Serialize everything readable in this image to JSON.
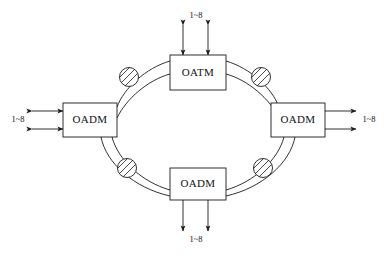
{
  "diagram": {
    "background_color": "#ffffff",
    "line_color": "#1a1a1a",
    "nodes": [
      {
        "id": "top",
        "label": "OATM",
        "position": "top",
        "tributary_label": "1~8",
        "tributary_side": "above"
      },
      {
        "id": "left",
        "label": "OADM",
        "position": "left",
        "tributary_label": "1~8",
        "tributary_side": "left"
      },
      {
        "id": "right",
        "label": "OADM",
        "position": "right",
        "tributary_label": "1~8",
        "tributary_side": "right"
      },
      {
        "id": "bottom",
        "label": "OADM",
        "position": "bottom",
        "tributary_label": "1~8",
        "tributary_side": "below"
      }
    ],
    "amplifiers": [
      {
        "id": "amp-top-left",
        "symbol": "hatched-circle",
        "position": "upper-left"
      },
      {
        "id": "amp-top-right",
        "symbol": "hatched-circle",
        "position": "upper-right"
      },
      {
        "id": "amp-bottom-left",
        "symbol": "hatched-circle",
        "position": "lower-left"
      },
      {
        "id": "amp-bottom-right",
        "symbol": "hatched-circle",
        "position": "lower-right"
      }
    ],
    "ring": {
      "fiber_count": 2,
      "description": "dual counter-rotating fiber ring"
    }
  }
}
